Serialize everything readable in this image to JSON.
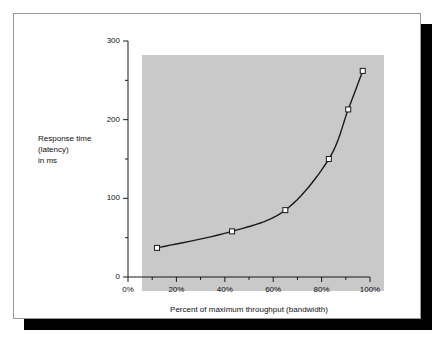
{
  "figure": {
    "background_color": "#ffffff",
    "card_border_color": "#9a9a9a",
    "shadow_color": "#000000"
  },
  "chart_data": {
    "type": "line",
    "title": "",
    "subtitle": "",
    "xlabel": "Percent of maximum throughput (bandwidth)",
    "ylabel_lines": [
      "Response time",
      "(latency)",
      "in ms"
    ],
    "ylabel": "Response time (latency) in ms",
    "xlim": [
      0,
      100
    ],
    "ylim": [
      0,
      300
    ],
    "x_ticks": [
      0,
      20,
      40,
      60,
      80,
      100
    ],
    "x_tick_labels": [
      "0%",
      "20%",
      "40%",
      "60%",
      "80%",
      "100%"
    ],
    "x_minor_ticks": [
      10,
      30,
      50,
      70,
      90
    ],
    "y_ticks": [
      0,
      100,
      200,
      300
    ],
    "y_tick_labels": [
      "0",
      "100",
      "200",
      "300"
    ],
    "y_minor_ticks": [
      50,
      150,
      250
    ],
    "grid": false,
    "legend": "none",
    "plot_background_color": "#c9c9c9",
    "line_color": "#1a1a1a",
    "marker": "open-square",
    "marker_fill": "#ffffff",
    "marker_edge": "#1a1a1a",
    "x": [
      12,
      43,
      65,
      83,
      91,
      97
    ],
    "values": [
      37,
      58,
      85,
      150,
      213,
      262
    ],
    "series": [
      {
        "name": "Response time vs throughput",
        "points": [
          {
            "x": 12,
            "y": 37
          },
          {
            "x": 43,
            "y": 58
          },
          {
            "x": 65,
            "y": 85
          },
          {
            "x": 83,
            "y": 150
          },
          {
            "x": 91,
            "y": 213
          },
          {
            "x": 97,
            "y": 262
          }
        ]
      }
    ]
  }
}
